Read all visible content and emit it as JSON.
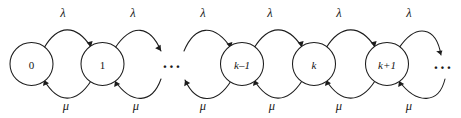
{
  "figure": {
    "type": "state-transition-diagram",
    "model": "birth-death-process",
    "background_color": "#ffffff",
    "ink_color": "#1c1c1c"
  },
  "nodes": [
    {
      "id": "s0",
      "label": "0",
      "cx": 31.5,
      "cy": 64,
      "r": 21.5,
      "italic": false
    },
    {
      "id": "s1",
      "label": "1",
      "cx": 102.5,
      "cy": 64,
      "r": 21.5,
      "italic": false
    },
    {
      "id": "sk-1",
      "label": "k–1",
      "cx": 242,
      "cy": 64,
      "r": 21.5,
      "italic": true
    },
    {
      "id": "sk",
      "label": "k",
      "cx": 314,
      "cy": 64,
      "r": 21.5,
      "italic": true
    },
    {
      "id": "sk+1",
      "label": "k+1",
      "cx": 387,
      "cy": 64,
      "r": 21.5,
      "italic": true
    }
  ],
  "ellipses": [
    {
      "id": "gap-left",
      "text": "···",
      "cx": 172,
      "cy": 66
    },
    {
      "id": "gap-right",
      "text": "···",
      "cx": 443,
      "cy": 67
    }
  ],
  "forward_rate": {
    "symbol": "λ",
    "name": "lambda",
    "description": "birth (arrival) rate"
  },
  "backward_rate": {
    "symbol": "μ",
    "name": "mu",
    "description": "death (service) rate"
  },
  "edges_forward": [
    {
      "id": "f0",
      "from": "s0",
      "to": "s1",
      "label": "λ",
      "label_x": 63,
      "label_y": 13
    },
    {
      "id": "f1",
      "from": "s1",
      "to": "gap-left",
      "label": "λ",
      "label_x": 133,
      "label_y": 13
    },
    {
      "id": "f2",
      "from": "gap-left",
      "to": "sk-1",
      "label": "λ",
      "label_x": 203,
      "label_y": 13
    },
    {
      "id": "f3",
      "from": "sk-1",
      "to": "sk",
      "label": "λ",
      "label_x": 270,
      "label_y": 13
    },
    {
      "id": "f4",
      "from": "sk",
      "to": "sk+1",
      "label": "λ",
      "label_x": 339,
      "label_y": 13
    },
    {
      "id": "f5",
      "from": "sk+1",
      "to": "gap-right",
      "label": "λ",
      "label_x": 409,
      "label_y": 13
    }
  ],
  "edges_backward": [
    {
      "id": "b0",
      "from": "s1",
      "to": "s0",
      "label": "μ",
      "label_x": 66,
      "label_y": 106
    },
    {
      "id": "b1",
      "from": "gap-left",
      "to": "s1",
      "label": "μ",
      "label_x": 136,
      "label_y": 106
    },
    {
      "id": "b2",
      "from": "sk-1",
      "to": "gap-left",
      "label": "μ",
      "label_x": 203,
      "label_y": 106
    },
    {
      "id": "b3",
      "from": "sk",
      "to": "sk-1",
      "label": "μ",
      "label_x": 272,
      "label_y": 106
    },
    {
      "id": "b4",
      "from": "sk+1",
      "to": "sk",
      "label": "μ",
      "label_x": 339,
      "label_y": 106
    },
    {
      "id": "b5",
      "from": "gap-right",
      "to": "sk+1",
      "label": "μ",
      "label_x": 409,
      "label_y": 106
    }
  ]
}
